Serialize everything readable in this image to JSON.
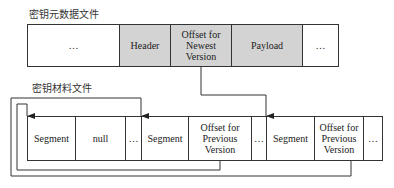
{
  "metadata_file": {
    "title": "密钥元数据文件",
    "cells": [
      {
        "label": "…",
        "shaded": false
      },
      {
        "label": "Header",
        "shaded": true
      },
      {
        "label": "Offset for Newest Version",
        "shaded": true
      },
      {
        "label": "Payload",
        "shaded": true
      },
      {
        "label": "…",
        "shaded": false
      }
    ]
  },
  "material_file": {
    "title": "密钥材料文件",
    "cells": [
      {
        "label": "Segment"
      },
      {
        "label": "null"
      },
      {
        "label": "…"
      },
      {
        "label": "Segment"
      },
      {
        "label": "Offset for Previous Version"
      },
      {
        "label": "…"
      },
      {
        "label": "Segment"
      },
      {
        "label": "Offset for Previous Version"
      },
      {
        "label": "…"
      }
    ]
  },
  "colors": {
    "shaded": "#d3d3d3",
    "line": "#333333"
  }
}
